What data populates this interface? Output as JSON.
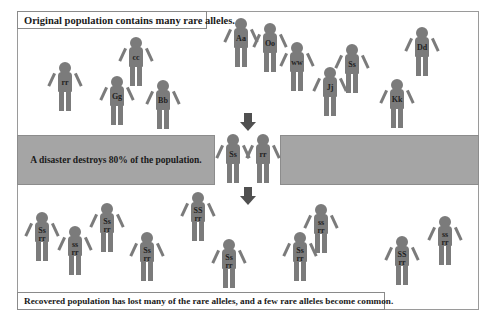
{
  "captions": {
    "top": "Original population contains many rare alleles.",
    "middle": "A disaster destroys 80% of the population.",
    "bottom": "Recovered population has lost many of the rare alleles, and a few rare alleles become common."
  },
  "colors": {
    "figure": "#7b7b7b",
    "band": "#a5a5a5",
    "arrow": "#505050",
    "frame": "#9a9a9a"
  },
  "original_population": [
    {
      "genotype": "rr",
      "x": 65,
      "y": 62
    },
    {
      "genotype": "cc",
      "x": 136,
      "y": 37
    },
    {
      "genotype": "Gg",
      "x": 117,
      "y": 76
    },
    {
      "genotype": "Bb",
      "x": 163,
      "y": 80
    },
    {
      "genotype": "Aa",
      "x": 241,
      "y": 18
    },
    {
      "genotype": "Oo",
      "x": 270,
      "y": 23
    },
    {
      "genotype": "ww",
      "x": 297,
      "y": 42
    },
    {
      "genotype": "Jj",
      "x": 330,
      "y": 67
    },
    {
      "genotype": "Ss",
      "x": 352,
      "y": 44
    },
    {
      "genotype": "Kk",
      "x": 397,
      "y": 79
    },
    {
      "genotype": "Dd",
      "x": 422,
      "y": 27
    }
  ],
  "survivors": [
    {
      "genotype": "Ss",
      "x": 233,
      "y": 134
    },
    {
      "genotype": "rr",
      "x": 263,
      "y": 134
    }
  ],
  "recovered_population": [
    {
      "genotype1": "Ss",
      "genotype2": "rr",
      "x": 42,
      "y": 212
    },
    {
      "genotype1": "ss",
      "genotype2": "rr",
      "x": 75,
      "y": 226
    },
    {
      "genotype1": "Ss",
      "genotype2": "rr",
      "x": 107,
      "y": 203
    },
    {
      "genotype1": "Ss",
      "genotype2": "rr",
      "x": 147,
      "y": 232
    },
    {
      "genotype1": "SS",
      "genotype2": "rr",
      "x": 198,
      "y": 192
    },
    {
      "genotype1": "Ss",
      "genotype2": "rr",
      "x": 229,
      "y": 239
    },
    {
      "genotype1": "Ss",
      "genotype2": "rr",
      "x": 300,
      "y": 232
    },
    {
      "genotype1": "ss",
      "genotype2": "rr",
      "x": 321,
      "y": 204
    },
    {
      "genotype1": "SS",
      "genotype2": "rr",
      "x": 402,
      "y": 236
    },
    {
      "genotype1": "ss",
      "genotype2": "rr",
      "x": 445,
      "y": 216
    }
  ],
  "arrows": [
    {
      "name": "down-arrow-to-disaster",
      "x": 240,
      "y": 113
    },
    {
      "name": "down-arrow-to-recovery",
      "x": 240,
      "y": 187
    }
  ]
}
